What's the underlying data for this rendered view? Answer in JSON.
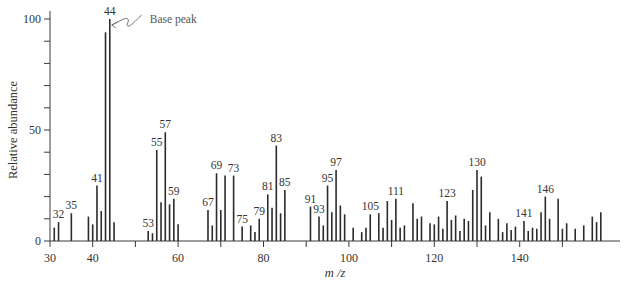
{
  "chart_data": {
    "type": "bar",
    "title": "",
    "xlabel": "m/z",
    "ylabel": "Relative abundance",
    "xlim": [
      30,
      160
    ],
    "ylim": [
      0,
      100
    ],
    "x_ticks": [
      30,
      40,
      50,
      60,
      70,
      80,
      90,
      100,
      110,
      120,
      130,
      140,
      150
    ],
    "x_tick_labels": [
      "30",
      "40",
      "",
      "60",
      "",
      "80",
      "",
      "100",
      "",
      "120",
      "",
      "140",
      ""
    ],
    "y_ticks": [
      0,
      10,
      20,
      30,
      40,
      50,
      60,
      70,
      80,
      90,
      100
    ],
    "y_tick_labels": [
      "0",
      "",
      "",
      "",
      "",
      "50",
      "",
      "",
      "",
      "",
      "100"
    ],
    "grid": false,
    "legend": null,
    "annotations": [
      {
        "text": "Base peak",
        "target_mz": 44
      }
    ],
    "labeled_peaks": [
      32,
      35,
      41,
      44,
      53,
      55,
      57,
      59,
      67,
      69,
      73,
      75,
      79,
      81,
      83,
      85,
      91,
      93,
      95,
      97,
      105,
      111,
      123,
      130,
      141,
      146
    ],
    "peaks": [
      {
        "mz": 31,
        "abundance": 6
      },
      {
        "mz": 32,
        "abundance": 8.5
      },
      {
        "mz": 35,
        "abundance": 12.5
      },
      {
        "mz": 39,
        "abundance": 11
      },
      {
        "mz": 40,
        "abundance": 7.5
      },
      {
        "mz": 41,
        "abundance": 25
      },
      {
        "mz": 42,
        "abundance": 13.5
      },
      {
        "mz": 43,
        "abundance": 94
      },
      {
        "mz": 44,
        "abundance": 100
      },
      {
        "mz": 45,
        "abundance": 8.5
      },
      {
        "mz": 53,
        "abundance": 4.5
      },
      {
        "mz": 54,
        "abundance": 3.5
      },
      {
        "mz": 55,
        "abundance": 41
      },
      {
        "mz": 56,
        "abundance": 17.5
      },
      {
        "mz": 57,
        "abundance": 49
      },
      {
        "mz": 58,
        "abundance": 16.5
      },
      {
        "mz": 59,
        "abundance": 19
      },
      {
        "mz": 60,
        "abundance": 7.5
      },
      {
        "mz": 67,
        "abundance": 14
      },
      {
        "mz": 68,
        "abundance": 7
      },
      {
        "mz": 69,
        "abundance": 30.5
      },
      {
        "mz": 70,
        "abundance": 14
      },
      {
        "mz": 71,
        "abundance": 29.5
      },
      {
        "mz": 73,
        "abundance": 29.5
      },
      {
        "mz": 75,
        "abundance": 6.5
      },
      {
        "mz": 77,
        "abundance": 7
      },
      {
        "mz": 78,
        "abundance": 4
      },
      {
        "mz": 79,
        "abundance": 10
      },
      {
        "mz": 81,
        "abundance": 21
      },
      {
        "mz": 82,
        "abundance": 15
      },
      {
        "mz": 83,
        "abundance": 43
      },
      {
        "mz": 84,
        "abundance": 12.5
      },
      {
        "mz": 85,
        "abundance": 23
      },
      {
        "mz": 91,
        "abundance": 15.5
      },
      {
        "mz": 93,
        "abundance": 11
      },
      {
        "mz": 94,
        "abundance": 7
      },
      {
        "mz": 95,
        "abundance": 25
      },
      {
        "mz": 96,
        "abundance": 13
      },
      {
        "mz": 97,
        "abundance": 32
      },
      {
        "mz": 98,
        "abundance": 16
      },
      {
        "mz": 99,
        "abundance": 12
      },
      {
        "mz": 101,
        "abundance": 6
      },
      {
        "mz": 103,
        "abundance": 4
      },
      {
        "mz": 104,
        "abundance": 6
      },
      {
        "mz": 105,
        "abundance": 12
      },
      {
        "mz": 107,
        "abundance": 12.5
      },
      {
        "mz": 108,
        "abundance": 6
      },
      {
        "mz": 109,
        "abundance": 18
      },
      {
        "mz": 110,
        "abundance": 9.5
      },
      {
        "mz": 111,
        "abundance": 19
      },
      {
        "mz": 112,
        "abundance": 6
      },
      {
        "mz": 113,
        "abundance": 7
      },
      {
        "mz": 115,
        "abundance": 17
      },
      {
        "mz": 116,
        "abundance": 10
      },
      {
        "mz": 117,
        "abundance": 11
      },
      {
        "mz": 119,
        "abundance": 8
      },
      {
        "mz": 120,
        "abundance": 7.5
      },
      {
        "mz": 121,
        "abundance": 11
      },
      {
        "mz": 122,
        "abundance": 5.5
      },
      {
        "mz": 123,
        "abundance": 18
      },
      {
        "mz": 124,
        "abundance": 9.5
      },
      {
        "mz": 125,
        "abundance": 11.5
      },
      {
        "mz": 126,
        "abundance": 4.5
      },
      {
        "mz": 127,
        "abundance": 10
      },
      {
        "mz": 128,
        "abundance": 9
      },
      {
        "mz": 129,
        "abundance": 23
      },
      {
        "mz": 130,
        "abundance": 32
      },
      {
        "mz": 131,
        "abundance": 29
      },
      {
        "mz": 132,
        "abundance": 7
      },
      {
        "mz": 133,
        "abundance": 13
      },
      {
        "mz": 135,
        "abundance": 10
      },
      {
        "mz": 136,
        "abundance": 4
      },
      {
        "mz": 137,
        "abundance": 8
      },
      {
        "mz": 138,
        "abundance": 5
      },
      {
        "mz": 139,
        "abundance": 6.5
      },
      {
        "mz": 141,
        "abundance": 9
      },
      {
        "mz": 142,
        "abundance": 4.5
      },
      {
        "mz": 143,
        "abundance": 6
      },
      {
        "mz": 144,
        "abundance": 5.5
      },
      {
        "mz": 145,
        "abundance": 13
      },
      {
        "mz": 146,
        "abundance": 20
      },
      {
        "mz": 147,
        "abundance": 10
      },
      {
        "mz": 149,
        "abundance": 19
      },
      {
        "mz": 150,
        "abundance": 5.5
      },
      {
        "mz": 151,
        "abundance": 8
      },
      {
        "mz": 153,
        "abundance": 5.5
      },
      {
        "mz": 155,
        "abundance": 7
      },
      {
        "mz": 157,
        "abundance": 11
      },
      {
        "mz": 158,
        "abundance": 8.5
      },
      {
        "mz": 159,
        "abundance": 13
      }
    ]
  },
  "labels": {
    "xlabel": "m /z",
    "ylabel": "Relative abundance",
    "annotation": "Base peak"
  },
  "layout": {
    "x0_px": 50,
    "x_per_unit": 4.27,
    "y0_px": 241,
    "y_per_unit": 2.22,
    "axis_end_px": 620
  }
}
